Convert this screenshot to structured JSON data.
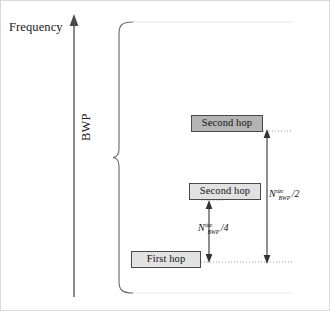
{
  "figure": {
    "domain": "diagram",
    "kind": "frequency-hopping-schematic",
    "width": 330,
    "height": 311,
    "background": "#ffffff",
    "border_color": "#d9d9d9"
  },
  "axis": {
    "label": "Frequency",
    "orientation": "vertical",
    "arrow": "up",
    "color": "#4a4a4a",
    "x": 73,
    "y_top": 14,
    "y_bottom": 296
  },
  "bwp": {
    "label": "BWP",
    "rotation_deg": -90,
    "brace_color": "#6e6e6e",
    "brace_x": 118,
    "brace_top": 20,
    "brace_bottom": 292
  },
  "blocks": [
    {
      "id": "second-hop-top",
      "label": "Second hop",
      "fill": "#b4b4b4",
      "border": "#4a4a4a",
      "x": 190,
      "y": 114,
      "width": 72,
      "height": 17
    },
    {
      "id": "second-hop-mid",
      "label": "Second hop",
      "fill": "#e2e2e2",
      "border": "#4a4a4a",
      "x": 188,
      "y": 182,
      "width": 72,
      "height": 17
    },
    {
      "id": "first-hop",
      "label": "First hop",
      "fill": "#e2e2e2",
      "border": "#4a4a4a",
      "x": 130,
      "y": 250,
      "width": 70,
      "height": 17
    }
  ],
  "dimensions": [
    {
      "id": "offset-half",
      "symbol": "N",
      "superscript": "size",
      "subscript": "BWP",
      "divisor": "/2",
      "text": "N^size_BWP /2",
      "arrow_x": 266,
      "arrow_top": 130,
      "arrow_bottom": 261,
      "double_headed": true
    },
    {
      "id": "offset-quarter",
      "symbol": "N",
      "superscript": "size",
      "subscript": "BWP",
      "divisor": "/4",
      "text": "N^size_BWP /4",
      "arrow_x": 208,
      "arrow_top": 199,
      "arrow_bottom": 261,
      "double_headed": true
    }
  ],
  "leaders": [
    {
      "id": "leader-top-hop",
      "y": 130,
      "x_from": 262,
      "x_to": 290
    },
    {
      "id": "leader-mid-hop",
      "y": 199,
      "x_from": 208,
      "x_to": 218
    },
    {
      "id": "leader-first-hop",
      "y": 261,
      "x_from": 200,
      "x_to": 290
    }
  ]
}
